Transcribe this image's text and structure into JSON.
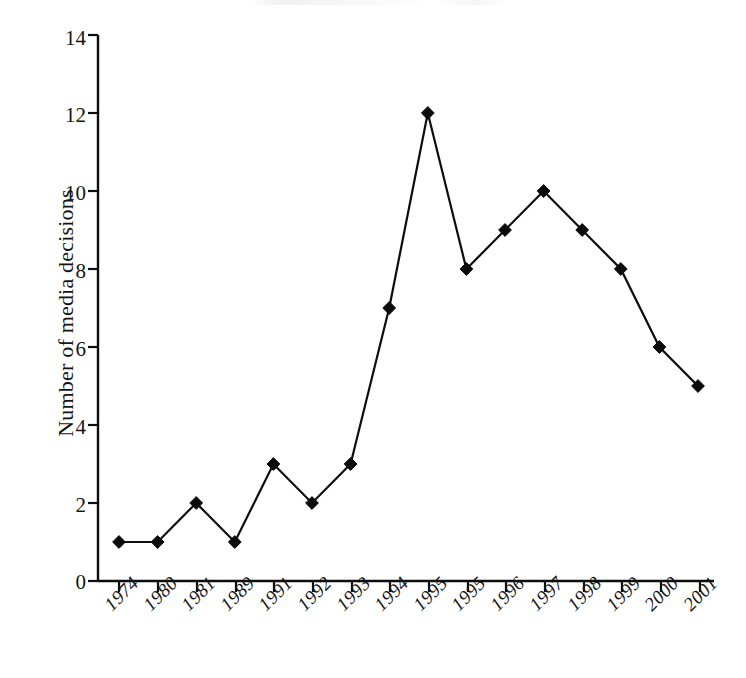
{
  "chart_data": {
    "type": "line",
    "title": "",
    "subtitle": "",
    "xlabel": "",
    "ylabel": "Number of media decisions",
    "categories": [
      "1974",
      "1980",
      "1981",
      "1989",
      "1991",
      "1992",
      "1993",
      "1994",
      "1995",
      "1995",
      "1996",
      "1997",
      "1998",
      "1999",
      "2000",
      "2001"
    ],
    "values": [
      1,
      1,
      2,
      1,
      3,
      2,
      3,
      7,
      12,
      8,
      9,
      10,
      9,
      8,
      6,
      5
    ],
    "series": [
      {
        "name": "Number of media decisions",
        "values": [
          1,
          1,
          2,
          1,
          3,
          2,
          3,
          7,
          12,
          8,
          9,
          10,
          9,
          8,
          6,
          5
        ]
      }
    ],
    "points": [
      {
        "x": "1974",
        "y": 1
      },
      {
        "x": "1980",
        "y": 1
      },
      {
        "x": "1981",
        "y": 2
      },
      {
        "x": "1989",
        "y": 1
      },
      {
        "x": "1991",
        "y": 3
      },
      {
        "x": "1992",
        "y": 2
      },
      {
        "x": "1993",
        "y": 3
      },
      {
        "x": "1994",
        "y": 7
      },
      {
        "x": "1995",
        "y": 12
      },
      {
        "x": "1995",
        "y": 8
      },
      {
        "x": "1996",
        "y": 9
      },
      {
        "x": "1997",
        "y": 10
      },
      {
        "x": "1998",
        "y": 9
      },
      {
        "x": "1999",
        "y": 8
      },
      {
        "x": "2000",
        "y": 6
      },
      {
        "x": "2001",
        "y": 5
      }
    ],
    "ylim": [
      0,
      14
    ],
    "y_ticks": [
      0,
      2,
      4,
      6,
      8,
      10,
      12,
      14
    ],
    "y_tick_labels": [
      "0",
      "2",
      "4",
      "6",
      "8",
      "10",
      "12",
      "14"
    ],
    "grid": false,
    "legend": false,
    "legend_position": "none",
    "marker": "diamond",
    "line_color": "#0d0d0d",
    "marker_color": "#0b0b0b",
    "background_color": "#ffffff"
  }
}
